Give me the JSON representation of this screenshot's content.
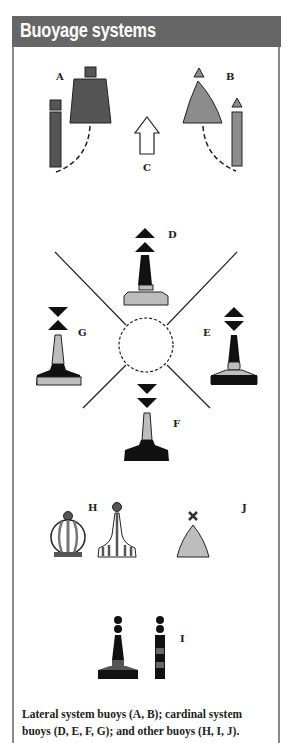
{
  "header": {
    "title": "Buoyage systems"
  },
  "colors": {
    "header_bg": "#666666",
    "dark_red": "#555555",
    "green_grey": "#8c8c8c",
    "light_grey": "#bdbdbd",
    "black": "#111111"
  },
  "labels": {
    "A": "A",
    "B": "B",
    "C": "C",
    "D": "D",
    "E": "E",
    "F": "F",
    "G": "G",
    "H": "H",
    "I": "I",
    "J": "J"
  },
  "groups": {
    "lateral": [
      "A",
      "B"
    ],
    "direction_arrow": "C",
    "cardinal": [
      "D",
      "E",
      "F",
      "G"
    ],
    "other": [
      "H",
      "I",
      "J"
    ]
  },
  "caption": {
    "line1": "Lateral system buoys (A, B); cardinal system",
    "line2": "buoys (D, E, F, G); and other buoys (H, I, J)."
  }
}
